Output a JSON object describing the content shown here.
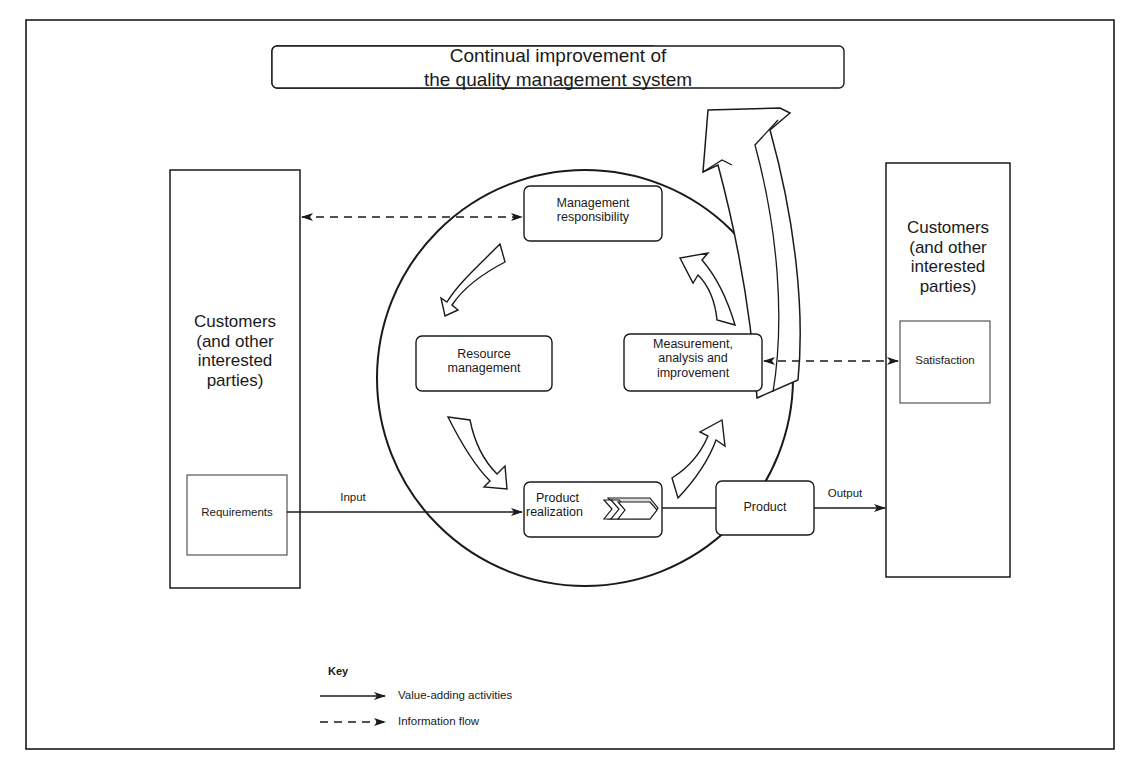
{
  "title": {
    "line1": "Continual improvement of",
    "line2": "the quality management system"
  },
  "left_party": {
    "line1": "Customers",
    "line2": "(and other",
    "line3": "interested",
    "line4": "parties)",
    "inner_box": "Requirements"
  },
  "right_party": {
    "line1": "Customers",
    "line2": "(and other",
    "line3": "interested",
    "line4": "parties)",
    "inner_box": "Satisfaction"
  },
  "processes": {
    "management_responsibility": {
      "line1": "Management",
      "line2": "responsibility"
    },
    "resource_management": {
      "line1": "Resource",
      "line2": "management"
    },
    "measurement": {
      "line1": "Measurement,",
      "line2": "analysis and",
      "line3": "improvement"
    },
    "product_realization": {
      "line1": "Product",
      "line2": "realization"
    },
    "product": "Product"
  },
  "flows": {
    "input_label": "Input",
    "output_label": "Output"
  },
  "key": {
    "title": "Key",
    "items": [
      {
        "style": "solid",
        "label": "Value-adding activities"
      },
      {
        "style": "dashed",
        "label": "Information flow"
      }
    ]
  },
  "colors": {
    "line": "#1a1a1a",
    "background": "#ffffff"
  }
}
